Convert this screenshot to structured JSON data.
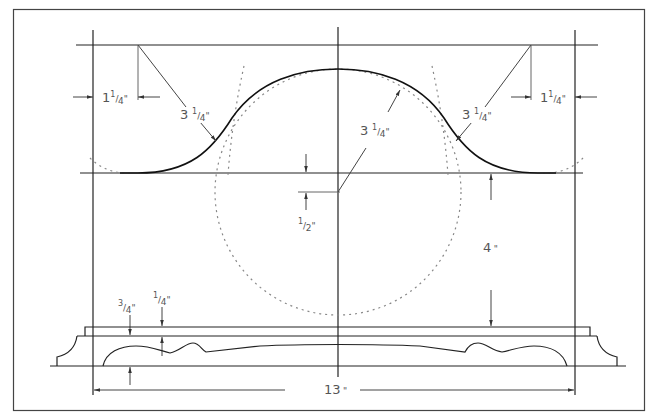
{
  "colors": {
    "line": "#222222",
    "construction": "#777777",
    "text": "#555555",
    "background": "#ffffff"
  },
  "dimensions": {
    "left_inset": {
      "whole": "1",
      "num": "1",
      "den": "4",
      "unit": "\""
    },
    "right_inset": {
      "whole": "1",
      "num": "1",
      "den": "4",
      "unit": "\""
    },
    "left_radius": {
      "whole": "3",
      "num": "1",
      "den": "4",
      "unit": "\""
    },
    "right_radius": {
      "whole": "3",
      "num": "1",
      "den": "4",
      "unit": "\""
    },
    "center_radius": {
      "whole": "3",
      "num": "1",
      "den": "4",
      "unit": "\""
    },
    "center_offset": {
      "num": "1",
      "den": "2",
      "unit": "\""
    },
    "height": {
      "value": "4",
      "unit": " \""
    },
    "base_thickness": {
      "num": "3",
      "den": "4",
      "unit": "\""
    },
    "plate_thickness": {
      "num": "1",
      "den": "4",
      "unit": "\""
    },
    "overall_width": {
      "value": "13",
      "unit": " \""
    }
  }
}
